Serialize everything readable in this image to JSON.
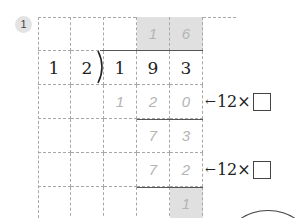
{
  "problem": {
    "number": "1"
  },
  "division": {
    "divisor": [
      "1",
      "2"
    ],
    "dividend": [
      "1",
      "9",
      "3"
    ],
    "quotient": [
      "1",
      "6"
    ],
    "step1_product": [
      "1",
      "2",
      "0"
    ],
    "step1_remainder": [
      "7",
      "3"
    ],
    "step2_product": [
      "7",
      "2"
    ],
    "remainder": [
      "1"
    ]
  },
  "annotations": {
    "row3": {
      "arrow": "←",
      "label": "12×"
    },
    "row5": {
      "arrow": "←",
      "label": "12×"
    }
  },
  "colors": {
    "highlight": "#e0e0e0",
    "handwriting": "#b4b4b4",
    "grid": "#a8a8a8"
  }
}
